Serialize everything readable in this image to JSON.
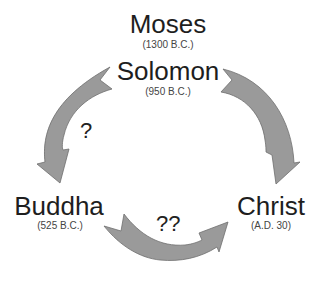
{
  "diagram": {
    "nodes": [
      {
        "id": "moses",
        "name": "Moses",
        "date": "(1300 B.C.)"
      },
      {
        "id": "solomon",
        "name": "Solomon",
        "date": "(950 B.C.)"
      },
      {
        "id": "buddha",
        "name": "Buddha",
        "date": "(525 B.C.)"
      },
      {
        "id": "christ",
        "name": "Christ",
        "date": "(A.D. 30)"
      }
    ],
    "edges": [
      {
        "from": "solomon",
        "to": "buddha",
        "label": "?"
      },
      {
        "from": "solomon",
        "to": "christ",
        "label": ""
      },
      {
        "from": "buddha",
        "to": "christ",
        "label": "??"
      }
    ],
    "colors": {
      "arrow_fill": "#9a9a9a",
      "arrow_stroke": "#6e6e6e",
      "text": "#1e1e1e"
    }
  }
}
